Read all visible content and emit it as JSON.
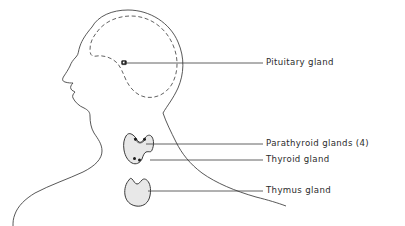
{
  "figure": {
    "title": "",
    "background_color": "#ffffff",
    "line_color": "#3a3a3a",
    "text_color": "#2b2b2b",
    "organ_fill_color": "#e8e8e8",
    "marker_color": "#1a1a1a"
  },
  "labels": [
    {
      "id": "pituitary",
      "text": "Pituitary gland",
      "x": 266,
      "y": 62,
      "leader_from_x": 124,
      "leader_from_y": 63,
      "leader_to_x": 263,
      "leader_to_y": 63
    },
    {
      "id": "parathyroid",
      "text": "Parathyroid glands (4)",
      "x": 266,
      "y": 140,
      "leader_from_x": 146,
      "leader_from_y": 144,
      "leader_to_x": 263,
      "leader_to_y": 144
    },
    {
      "id": "thyroid",
      "text": "Thyroid  gland",
      "x": 266,
      "y": 157,
      "leader_from_x": 150,
      "leader_from_y": 160,
      "leader_to_x": 263,
      "leader_to_y": 160
    },
    {
      "id": "thymus",
      "text": "Thymus gland",
      "x": 266,
      "y": 188,
      "leader_from_x": 148,
      "leader_from_y": 191,
      "leader_to_x": 263,
      "leader_to_y": 191
    }
  ],
  "anatomy": {
    "head_outline_name": "head-profile-outline",
    "cranial_cavity_name": "cranial-cavity-dashed-outline",
    "pituitary_marker_name": "pituitary-gland-marker",
    "thyroid_name": "thyroid-gland-shape",
    "parathyroid_name": "parathyroid-gland-dots",
    "thymus_name": "thymus-gland-shape",
    "neck_front_name": "neck-front-contour",
    "neck_back_name": "neck-back-contour"
  }
}
